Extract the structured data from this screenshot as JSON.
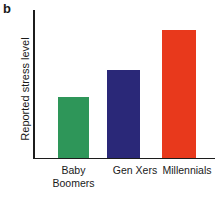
{
  "figure": {
    "panel_label": "b",
    "background_color": "#ffffff",
    "axis_color": "#1c1c1c"
  },
  "chart_data": {
    "type": "bar",
    "title": "",
    "subtitle": "",
    "xlabel": "",
    "ylabel": "Reported stress level",
    "categories": [
      "Baby Boomers",
      "Gen Xers",
      "Millennials"
    ],
    "category_label_lines": [
      [
        "Baby",
        "Boomers"
      ],
      [
        "Gen Xers"
      ],
      [
        "Millennials"
      ]
    ],
    "values": [
      61,
      88,
      128
    ],
    "ylim": [
      0,
      148
    ],
    "y_tick_labels": [],
    "x_tick_labels": [
      "Baby Boomers",
      "Gen Xers",
      "Millennials"
    ],
    "grid": false,
    "legend": false,
    "legend_position": "none",
    "annotations": [],
    "series": [
      {
        "name": "Reported stress level",
        "values": [
          61,
          88,
          128
        ],
        "colors": [
          "#2e9659",
          "#2a2878",
          "#e8391c"
        ]
      }
    ],
    "bar_colors": {
      "baby_boomers": "#2e9659",
      "gen_xers": "#2a2878",
      "millennials": "#e8391c"
    },
    "bar_geometry": [
      {
        "left": 58,
        "width": 31,
        "height": 61
      },
      {
        "left": 107,
        "width": 33,
        "height": 88
      },
      {
        "left": 162,
        "width": 34,
        "height": 128
      }
    ],
    "label_geometry": [
      {
        "left": 43,
        "width": 61
      },
      {
        "left": 105,
        "width": 60
      },
      {
        "left": 154,
        "width": 66
      }
    ]
  }
}
